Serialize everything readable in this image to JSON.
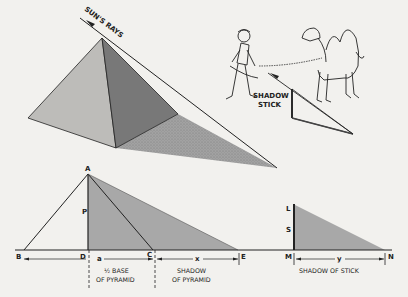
{
  "figure": {
    "top": {
      "sun_label": "SUN'S RAYS",
      "stick_label_1": "SHADOW",
      "stick_label_2": "STICK"
    },
    "bottom": {
      "points": {
        "A": "A",
        "B": "B",
        "C": "C",
        "D": "D",
        "E": "E",
        "L": "L",
        "M": "M",
        "N": "N",
        "P": "P",
        "S": "S"
      },
      "a_label": "a",
      "x_label": "x",
      "y_label": "y",
      "half_base_1": "½ BASE",
      "half_base_2": "OF PYRAMID",
      "shadow_pyr_1": "SHADOW",
      "shadow_pyr_2": "OF PYRAMID",
      "shadow_stick": "SHADOW OF STICK"
    },
    "colors": {
      "ink": "#222222",
      "shade": "#9a9a9a",
      "paper": "#f2f1ee"
    }
  }
}
